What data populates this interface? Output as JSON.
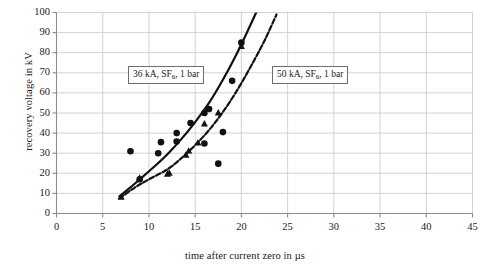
{
  "chart_data": {
    "type": "scatter",
    "title": "",
    "xlabel": "time after current zero in µs",
    "ylabel": "recovery voltage in kV",
    "xlim": [
      0,
      45
    ],
    "ylim": [
      0,
      100
    ],
    "xticks": [
      0,
      5,
      10,
      15,
      20,
      25,
      30,
      35,
      40,
      45
    ],
    "yticks": [
      0,
      10,
      20,
      30,
      40,
      50,
      60,
      70,
      80,
      90,
      100
    ],
    "grid": true,
    "legend_position": "inline-annotations",
    "series": [
      {
        "name": "36 kA, SF6, 1 bar",
        "label_html": "36 kA, SF<sub>6</sub>, 1 bar",
        "marker": "filled-circle",
        "color": "#111111",
        "points": [
          [
            8.0,
            31.0
          ],
          [
            9.0,
            17.0
          ],
          [
            11.0,
            30.0
          ],
          [
            11.3,
            35.5
          ],
          [
            13.0,
            35.8
          ],
          [
            13.0,
            40.0
          ],
          [
            14.5,
            45.0
          ],
          [
            16.0,
            34.8
          ],
          [
            16.0,
            50.0
          ],
          [
            16.5,
            52.0
          ],
          [
            17.5,
            24.8
          ],
          [
            18.0,
            40.5
          ],
          [
            19.0,
            66.0
          ],
          [
            20.0,
            85.0
          ]
        ],
        "fit_curve": {
          "style": "solid",
          "points": [
            [
              6.8,
              8.5
            ],
            [
              8.0,
              13.0
            ],
            [
              9.0,
              17.0
            ],
            [
              10.5,
              23.0
            ],
            [
              12.0,
              29.5
            ],
            [
              13.5,
              37.0
            ],
            [
              15.0,
              45.5
            ],
            [
              16.5,
              55.0
            ],
            [
              18.0,
              66.5
            ],
            [
              19.5,
              79.5
            ],
            [
              20.8,
              92.0
            ],
            [
              21.7,
              101.0
            ]
          ]
        }
      },
      {
        "name": "50 kA, SF6, 1 bar",
        "label_html": "50 kA, SF<sub>6</sub>, 1 bar",
        "marker": "filled-triangle",
        "color": "#111111",
        "points": [
          [
            7.0,
            8.0
          ],
          [
            9.0,
            17.5
          ],
          [
            12.0,
            19.5
          ],
          [
            12.2,
            20.0
          ],
          [
            14.0,
            29.0
          ],
          [
            14.3,
            31.0
          ],
          [
            15.3,
            35.0
          ],
          [
            16.0,
            44.5
          ],
          [
            17.5,
            50.0
          ],
          [
            20.0,
            83.0
          ]
        ],
        "fit_curve": {
          "style": "dashed",
          "points": [
            [
              6.8,
              7.5
            ],
            [
              8.5,
              13.0
            ],
            [
              10.0,
              17.0
            ],
            [
              12.0,
              22.0
            ],
            [
              13.5,
              27.5
            ],
            [
              15.0,
              34.0
            ],
            [
              16.5,
              41.5
            ],
            [
              18.0,
              50.5
            ],
            [
              19.5,
              61.0
            ],
            [
              21.0,
              73.0
            ],
            [
              22.5,
              86.0
            ],
            [
              23.8,
              99.0
            ]
          ]
        }
      }
    ]
  },
  "artifact": {
    "text": ""
  }
}
